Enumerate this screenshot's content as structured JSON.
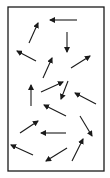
{
  "diagram": {
    "box": {
      "x": 8,
      "y": 7,
      "width": 96,
      "height": 164
    },
    "colors": {
      "stroke": "#1a1a1a",
      "background": "#ffffff"
    },
    "arrows": [
      {
        "x1": 77,
        "y1": 20,
        "x2": 50,
        "y2": 20
      },
      {
        "x1": 29,
        "y1": 43,
        "x2": 38,
        "y2": 23
      },
      {
        "x1": 67,
        "y1": 32,
        "x2": 67,
        "y2": 52
      },
      {
        "x1": 36,
        "y1": 61,
        "x2": 17,
        "y2": 51
      },
      {
        "x1": 43,
        "y1": 78,
        "x2": 52,
        "y2": 58
      },
      {
        "x1": 71,
        "y1": 68,
        "x2": 90,
        "y2": 56
      },
      {
        "x1": 31,
        "y1": 106,
        "x2": 31,
        "y2": 85
      },
      {
        "x1": 41,
        "y1": 92,
        "x2": 63,
        "y2": 82
      },
      {
        "x1": 68,
        "y1": 81,
        "x2": 61,
        "y2": 99
      },
      {
        "x1": 96,
        "y1": 104,
        "x2": 75,
        "y2": 93
      },
      {
        "x1": 66,
        "y1": 116,
        "x2": 44,
        "y2": 105
      },
      {
        "x1": 80,
        "y1": 116,
        "x2": 92,
        "y2": 136
      },
      {
        "x1": 20,
        "y1": 133,
        "x2": 38,
        "y2": 121
      },
      {
        "x1": 66,
        "y1": 133,
        "x2": 41,
        "y2": 133
      },
      {
        "x1": 33,
        "y1": 155,
        "x2": 11,
        "y2": 145
      },
      {
        "x1": 67,
        "y1": 148,
        "x2": 46,
        "y2": 161
      },
      {
        "x1": 72,
        "y1": 161,
        "x2": 83,
        "y2": 139
      }
    ]
  }
}
